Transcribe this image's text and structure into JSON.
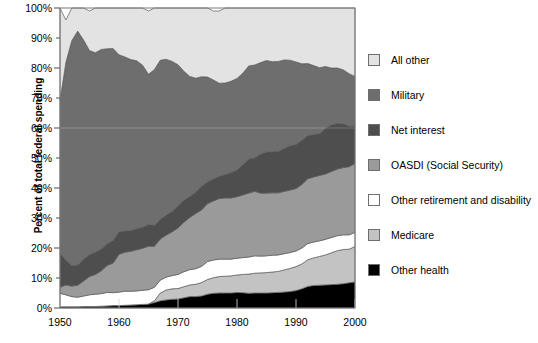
{
  "chart_data": {
    "type": "area",
    "stacked": true,
    "title": "",
    "xlabel": "",
    "ylabel": "Percent of total federal spending",
    "xlim": [
      1950,
      2000
    ],
    "ylim": [
      0,
      100
    ],
    "grid": false,
    "legend_position": "right",
    "xticks": [
      1950,
      1960,
      1970,
      1980,
      1990,
      2000
    ],
    "xtick_labels": [
      "1950",
      "1960",
      "1970",
      "1980",
      "1990",
      "2000"
    ],
    "yticks": [
      0,
      10,
      20,
      30,
      40,
      50,
      60,
      70,
      80,
      90,
      100
    ],
    "ytick_labels": [
      "0%",
      "10%",
      "20%",
      "30%",
      "40%",
      "50%",
      "60%",
      "70%",
      "80%",
      "90%",
      "100%"
    ],
    "x": [
      1950,
      1951,
      1952,
      1953,
      1954,
      1955,
      1956,
      1957,
      1958,
      1959,
      1960,
      1961,
      1962,
      1963,
      1964,
      1965,
      1966,
      1967,
      1968,
      1969,
      1970,
      1971,
      1972,
      1973,
      1974,
      1975,
      1976,
      1977,
      1978,
      1979,
      1980,
      1981,
      1982,
      1983,
      1984,
      1985,
      1986,
      1987,
      1988,
      1989,
      1990,
      1991,
      1992,
      1993,
      1994,
      1995,
      1996,
      1997,
      1998,
      1999,
      2000
    ],
    "series": [
      {
        "name": "Other health",
        "color": "#000000",
        "values": [
          0.4,
          0.4,
          0.4,
          0.4,
          0.5,
          0.5,
          0.5,
          0.6,
          0.7,
          0.8,
          0.8,
          0.9,
          1.0,
          1.1,
          1.2,
          1.3,
          1.8,
          2.4,
          2.7,
          2.9,
          3.0,
          3.4,
          3.8,
          3.8,
          4.0,
          4.6,
          4.9,
          5.0,
          5.0,
          5.0,
          5.2,
          5.1,
          4.9,
          5.0,
          5.0,
          5.0,
          5.1,
          5.2,
          5.3,
          5.5,
          5.8,
          6.4,
          7.2,
          7.5,
          7.6,
          7.7,
          7.8,
          7.9,
          8.1,
          8.4,
          8.7
        ]
      },
      {
        "name": "Medicare",
        "color": "#c3c3c3",
        "values": [
          0.0,
          0.0,
          0.0,
          0.0,
          0.0,
          0.0,
          0.0,
          0.0,
          0.0,
          0.0,
          0.0,
          0.0,
          0.0,
          0.0,
          0.0,
          0.0,
          0.6,
          2.6,
          3.3,
          3.5,
          3.5,
          3.7,
          3.9,
          4.1,
          4.5,
          4.9,
          5.2,
          5.5,
          5.6,
          5.7,
          5.8,
          6.1,
          6.4,
          6.6,
          6.7,
          6.8,
          6.9,
          7.0,
          7.4,
          7.7,
          8.0,
          8.3,
          8.9,
          9.2,
          9.6,
          10.0,
          10.6,
          11.2,
          11.4,
          11.2,
          11.8
        ]
      },
      {
        "name": "Other retirement and disability",
        "color": "#ffffff",
        "values": [
          4.5,
          4.0,
          3.4,
          3.2,
          3.5,
          3.9,
          4.1,
          4.2,
          4.5,
          4.3,
          4.5,
          4.7,
          4.6,
          4.6,
          4.7,
          4.8,
          4.5,
          4.3,
          4.3,
          4.4,
          4.7,
          5.0,
          5.1,
          5.2,
          5.4,
          6.0,
          5.9,
          5.8,
          5.7,
          5.6,
          5.6,
          5.6,
          5.7,
          5.8,
          5.6,
          5.6,
          5.6,
          5.5,
          5.4,
          5.3,
          5.2,
          5.3,
          5.4,
          5.3,
          5.2,
          5.2,
          5.1,
          5.0,
          4.9,
          4.8,
          4.7
        ]
      },
      {
        "name": "OASDI (Social Security)",
        "color": "#9a9a9a",
        "values": [
          2.0,
          3.3,
          3.5,
          4.0,
          5.0,
          6.1,
          6.6,
          7.6,
          9.0,
          9.9,
          12.6,
          13.0,
          13.3,
          13.7,
          14.0,
          14.5,
          13.7,
          13.7,
          14.0,
          14.6,
          15.5,
          16.5,
          17.4,
          18.4,
          18.8,
          19.3,
          19.7,
          20.2,
          20.4,
          20.4,
          20.5,
          20.9,
          21.3,
          21.5,
          21.0,
          20.9,
          20.8,
          20.7,
          20.8,
          20.8,
          20.8,
          21.2,
          21.6,
          21.7,
          21.8,
          21.8,
          22.0,
          22.2,
          22.4,
          22.7,
          23.0
        ]
      },
      {
        "name": "Net interest",
        "color": "#4e4e4e",
        "values": [
          11.3,
          8.2,
          6.8,
          6.7,
          7.3,
          7.3,
          7.4,
          7.3,
          7.2,
          7.5,
          7.5,
          7.1,
          6.9,
          7.0,
          7.0,
          7.3,
          6.9,
          6.6,
          6.6,
          6.8,
          7.4,
          7.3,
          7.0,
          7.1,
          7.9,
          7.2,
          7.3,
          7.4,
          7.8,
          8.4,
          8.9,
          10.1,
          11.4,
          11.1,
          13.0,
          13.7,
          13.7,
          13.8,
          14.3,
          14.8,
          14.7,
          14.7,
          14.4,
          14.1,
          13.9,
          15.3,
          15.5,
          15.2,
          14.6,
          13.5,
          12.5
        ]
      },
      {
        "name": "Military",
        "color": "#6e6e6e",
        "values": [
          51.0,
          66.0,
          75.0,
          78.0,
          73.0,
          68.0,
          66.5,
          66.5,
          65.0,
          64.0,
          59.0,
          58.0,
          57.0,
          56.0,
          54.0,
          50.0,
          52.0,
          53.0,
          52.0,
          50.0,
          47.0,
          43.0,
          40.0,
          38.0,
          36.5,
          35.0,
          33.0,
          31.0,
          30.5,
          30.5,
          30.5,
          30.5,
          31.0,
          31.0,
          30.5,
          30.5,
          30.0,
          30.0,
          29.5,
          28.5,
          27.5,
          25.5,
          24.0,
          23.0,
          22.0,
          20.5,
          19.0,
          18.5,
          18.0,
          17.5,
          16.5
        ]
      },
      {
        "name": "All other",
        "color": "#e3e3e3",
        "values": [
          30.8,
          14.1,
          10.9,
          7.7,
          10.7,
          13.2,
          14.9,
          13.8,
          13.6,
          13.5,
          15.6,
          16.3,
          17.2,
          17.6,
          19.1,
          21.1,
          20.5,
          17.4,
          17.1,
          17.8,
          18.9,
          21.1,
          22.8,
          23.4,
          22.9,
          23.0,
          23.0,
          24.1,
          25.0,
          24.4,
          23.5,
          21.7,
          19.3,
          19.0,
          18.2,
          17.5,
          17.9,
          17.8,
          17.3,
          17.4,
          18.0,
          18.6,
          18.5,
          19.2,
          19.9,
          19.5,
          20.0,
          20.0,
          20.6,
          21.9,
          22.8
        ]
      }
    ],
    "legend_entries": [
      {
        "label": "All other",
        "color": "#e3e3e3"
      },
      {
        "label": "Military",
        "color": "#6e6e6e"
      },
      {
        "label": "Net interest",
        "color": "#4e4e4e"
      },
      {
        "label": "OASDI (Social Security)",
        "color": "#9a9a9a"
      },
      {
        "label": "Other retirement and disability",
        "color": "#ffffff"
      },
      {
        "label": "Medicare",
        "color": "#c3c3c3"
      },
      {
        "label": "Other health",
        "color": "#000000"
      }
    ]
  },
  "plot": {
    "frame_color": "#7a7a7a",
    "background": "#ffffff"
  }
}
